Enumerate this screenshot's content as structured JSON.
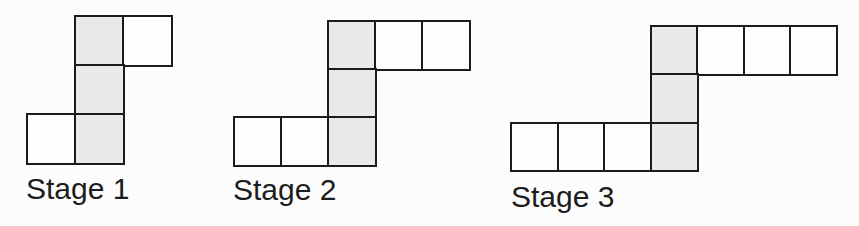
{
  "figure": {
    "background_color": "#fcfcfc",
    "line_color": "#1b1b1b",
    "shaded_fill": "#e9e9e9",
    "unshaded_fill": "#fdfdfd",
    "label_color": "#1c1c1c",
    "stages": [
      {
        "label": "Stage 1",
        "total_squares": 5,
        "shaded_squares": 3,
        "unshaded_squares": 2,
        "layout": {
          "origin_x": 26,
          "origin_y": 15,
          "cell_w": 48,
          "cell_h": 49,
          "label_x": 26,
          "label_y": 174
        },
        "squares": [
          {
            "row": 0,
            "col": 1,
            "shaded": true
          },
          {
            "row": 0,
            "col": 2,
            "shaded": false
          },
          {
            "row": 1,
            "col": 1,
            "shaded": true
          },
          {
            "row": 2,
            "col": 0,
            "shaded": false
          },
          {
            "row": 2,
            "col": 1,
            "shaded": true
          }
        ]
      },
      {
        "label": "Stage 2",
        "total_squares": 7,
        "shaded_squares": 3,
        "unshaded_squares": 4,
        "layout": {
          "origin_x": 233,
          "origin_y": 20,
          "cell_w": 47,
          "cell_h": 48,
          "label_x": 233,
          "label_y": 175
        },
        "squares": [
          {
            "row": 0,
            "col": 2,
            "shaded": true
          },
          {
            "row": 0,
            "col": 3,
            "shaded": false
          },
          {
            "row": 0,
            "col": 4,
            "shaded": false
          },
          {
            "row": 1,
            "col": 2,
            "shaded": true
          },
          {
            "row": 2,
            "col": 0,
            "shaded": false
          },
          {
            "row": 2,
            "col": 1,
            "shaded": false
          },
          {
            "row": 2,
            "col": 2,
            "shaded": true
          }
        ]
      },
      {
        "label": "Stage 3",
        "total_squares": 9,
        "shaded_squares": 3,
        "unshaded_squares": 6,
        "layout": {
          "origin_x": 510,
          "origin_y": 25,
          "cell_w": 46.5,
          "cell_h": 48.3,
          "label_x": 511,
          "label_y": 182
        },
        "squares": [
          {
            "row": 0,
            "col": 3,
            "shaded": true
          },
          {
            "row": 0,
            "col": 4,
            "shaded": false
          },
          {
            "row": 0,
            "col": 5,
            "shaded": false
          },
          {
            "row": 0,
            "col": 6,
            "shaded": false
          },
          {
            "row": 1,
            "col": 3,
            "shaded": true
          },
          {
            "row": 2,
            "col": 0,
            "shaded": false
          },
          {
            "row": 2,
            "col": 1,
            "shaded": false
          },
          {
            "row": 2,
            "col": 2,
            "shaded": false
          },
          {
            "row": 2,
            "col": 3,
            "shaded": true
          }
        ]
      }
    ]
  }
}
